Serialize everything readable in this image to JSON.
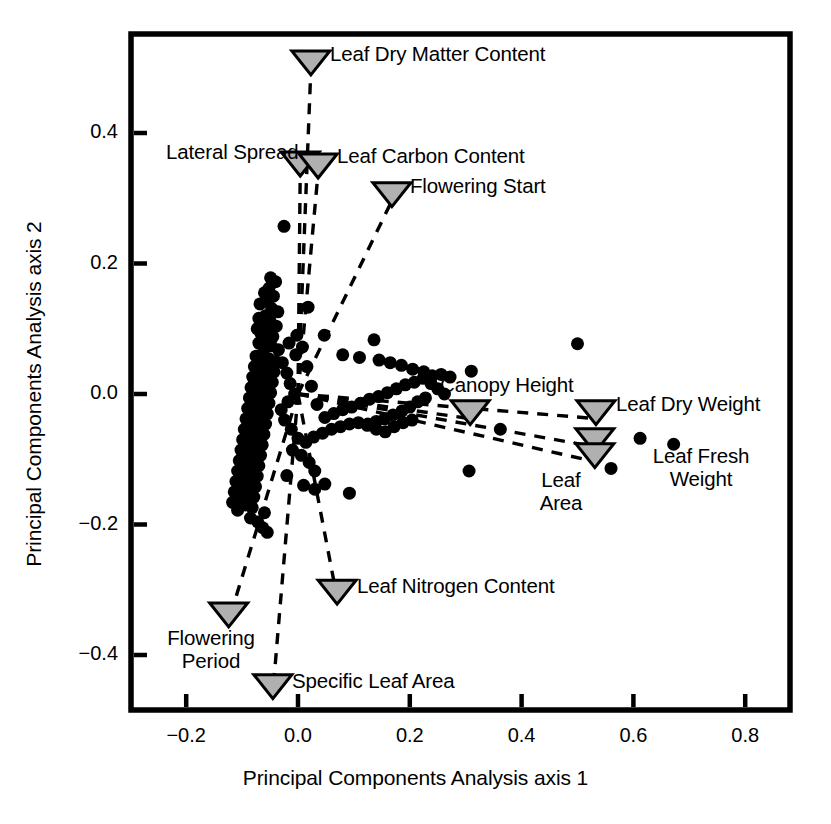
{
  "chart_data": {
    "type": "scatter",
    "title": "",
    "xlabel": "Principal Components Analysis axis 1",
    "ylabel": "Principal Components Analysis axis 2",
    "xlim": [
      -0.278,
      0.901
    ],
    "ylim": [
      -0.486,
      0.552
    ],
    "xticks": [
      -0.2,
      0.0,
      0.2,
      0.4,
      0.6,
      0.8
    ],
    "xticklabels": [
      "−0.2",
      "0.0",
      "0.2",
      "0.4",
      "0.6",
      "0.8"
    ],
    "yticks": [
      0.4,
      0.2,
      0.0,
      -0.2,
      -0.4
    ],
    "yticklabels": [
      "0.4",
      "0.2",
      "0.0",
      "−0.2",
      "−0.4"
    ],
    "grid": false,
    "legend": "none",
    "marker_color": "#000000",
    "marker_shape": "circle",
    "marker_size_px": 13,
    "loading_marker_shape": "triangle-down",
    "loading_marker_fill": "#b0b0b0",
    "loading_marker_stroke": "#000000",
    "loading_line_style": "dashed",
    "loading_origin": [
      0.0,
      0.0
    ],
    "series": [
      {
        "name": "species scores",
        "points": [
          [
            -0.025,
            0.257
          ],
          [
            -0.049,
            0.178
          ],
          [
            -0.04,
            0.172
          ],
          [
            -0.052,
            0.162
          ],
          [
            -0.06,
            0.155
          ],
          [
            -0.044,
            0.15
          ],
          [
            -0.055,
            0.142
          ],
          [
            -0.068,
            0.138
          ],
          [
            -0.047,
            0.131
          ],
          [
            0.018,
            0.133
          ],
          [
            -0.036,
            0.126
          ],
          [
            -0.058,
            0.12
          ],
          [
            -0.07,
            0.116
          ],
          [
            -0.05,
            0.112
          ],
          [
            -0.062,
            0.107
          ],
          [
            -0.039,
            0.104
          ],
          [
            -0.073,
            0.1
          ],
          [
            -0.054,
            0.096
          ],
          [
            -0.066,
            0.092
          ],
          [
            -0.045,
            0.088
          ],
          [
            0.047,
            0.09
          ],
          [
            0.136,
            0.083
          ],
          [
            -0.057,
            0.082
          ],
          [
            -0.07,
            0.078
          ],
          [
            -0.048,
            0.074
          ],
          [
            -0.06,
            0.07
          ],
          [
            -0.035,
            0.068
          ],
          [
            0.08,
            0.06
          ],
          [
            0.11,
            0.056
          ],
          [
            0.145,
            0.052
          ],
          [
            0.165,
            0.048
          ],
          [
            0.185,
            0.044
          ],
          [
            0.205,
            0.038
          ],
          [
            0.225,
            0.034
          ],
          [
            0.5,
            0.077
          ],
          [
            0.31,
            0.035
          ],
          [
            -0.063,
            0.062
          ],
          [
            -0.075,
            0.058
          ],
          [
            -0.052,
            0.054
          ],
          [
            -0.04,
            0.05
          ],
          [
            -0.066,
            0.046
          ],
          [
            -0.078,
            0.042
          ],
          [
            -0.055,
            0.038
          ],
          [
            -0.043,
            0.034
          ],
          [
            -0.069,
            0.03
          ],
          [
            -0.081,
            0.026
          ],
          [
            -0.058,
            0.022
          ],
          [
            -0.046,
            0.018
          ],
          [
            -0.072,
            0.014
          ],
          [
            -0.084,
            0.01
          ],
          [
            -0.061,
            0.006
          ],
          [
            -0.049,
            0.002
          ],
          [
            -0.075,
            -0.002
          ],
          [
            -0.087,
            -0.006
          ],
          [
            -0.064,
            -0.01
          ],
          [
            -0.052,
            -0.014
          ],
          [
            -0.078,
            -0.018
          ],
          [
            -0.09,
            -0.022
          ],
          [
            -0.067,
            -0.026
          ],
          [
            -0.055,
            -0.03
          ],
          [
            -0.081,
            -0.034
          ],
          [
            -0.093,
            -0.038
          ],
          [
            -0.07,
            -0.042
          ],
          [
            -0.058,
            -0.046
          ],
          [
            -0.084,
            -0.05
          ],
          [
            -0.096,
            -0.054
          ],
          [
            -0.073,
            -0.058
          ],
          [
            -0.061,
            -0.062
          ],
          [
            -0.087,
            -0.066
          ],
          [
            -0.099,
            -0.07
          ],
          [
            -0.076,
            -0.074
          ],
          [
            -0.064,
            -0.078
          ],
          [
            -0.09,
            -0.082
          ],
          [
            -0.102,
            -0.086
          ],
          [
            -0.079,
            -0.09
          ],
          [
            -0.067,
            -0.094
          ],
          [
            -0.093,
            -0.098
          ],
          [
            -0.105,
            -0.102
          ],
          [
            -0.082,
            -0.106
          ],
          [
            -0.07,
            -0.11
          ],
          [
            -0.096,
            -0.114
          ],
          [
            -0.108,
            -0.118
          ],
          [
            -0.085,
            -0.122
          ],
          [
            -0.073,
            -0.126
          ],
          [
            -0.099,
            -0.13
          ],
          [
            -0.111,
            -0.134
          ],
          [
            -0.088,
            -0.138
          ],
          [
            -0.076,
            -0.142
          ],
          [
            -0.102,
            -0.146
          ],
          [
            -0.114,
            -0.15
          ],
          [
            -0.091,
            -0.154
          ],
          [
            -0.079,
            -0.158
          ],
          [
            -0.105,
            -0.162
          ],
          [
            -0.117,
            -0.166
          ],
          [
            -0.094,
            -0.17
          ],
          [
            -0.082,
            -0.174
          ],
          [
            -0.108,
            -0.178
          ],
          [
            -0.06,
            -0.182
          ],
          [
            -0.085,
            -0.19
          ],
          [
            -0.072,
            -0.196
          ],
          [
            -0.063,
            -0.205
          ],
          [
            -0.055,
            -0.212
          ],
          [
            -0.02,
            -0.125
          ],
          [
            0.01,
            -0.14
          ],
          [
            0.03,
            -0.146
          ],
          [
            0.048,
            -0.138
          ],
          [
            0.092,
            -0.152
          ],
          [
            0.03,
            -0.118
          ],
          [
            0.02,
            -0.105
          ],
          [
            0.006,
            -0.094
          ],
          [
            -0.01,
            -0.086
          ],
          [
            0.014,
            -0.074
          ],
          [
            0.028,
            -0.066
          ],
          [
            0.044,
            -0.06
          ],
          [
            0.06,
            -0.054
          ],
          [
            0.076,
            -0.05
          ],
          [
            0.092,
            -0.046
          ],
          [
            0.108,
            -0.044
          ],
          [
            0.124,
            -0.048
          ],
          [
            0.14,
            -0.054
          ],
          [
            0.156,
            -0.058
          ],
          [
            0.172,
            -0.05
          ],
          [
            0.188,
            -0.044
          ],
          [
            0.204,
            -0.04
          ],
          [
            0.048,
            -0.036
          ],
          [
            0.064,
            -0.03
          ],
          [
            0.08,
            -0.024
          ],
          [
            0.096,
            -0.02
          ],
          [
            0.112,
            -0.014
          ],
          [
            0.128,
            -0.008
          ],
          [
            0.144,
            -0.004
          ],
          [
            0.16,
            0.002
          ],
          [
            0.176,
            0.008
          ],
          [
            0.192,
            0.014
          ],
          [
            0.208,
            0.018
          ],
          [
            0.224,
            0.024
          ],
          [
            0.24,
            0.028
          ],
          [
            0.256,
            0.03
          ],
          [
            0.272,
            0.026
          ],
          [
            0.238,
            0.016
          ],
          [
            0.25,
            0.008
          ],
          [
            0.262,
            0.0
          ],
          [
            0.228,
            -0.006
          ],
          [
            0.214,
            -0.012
          ],
          [
            0.2,
            -0.02
          ],
          [
            0.186,
            -0.026
          ],
          [
            0.17,
            -0.032
          ],
          [
            0.155,
            -0.038
          ],
          [
            0.14,
            -0.042
          ],
          [
            0.125,
            -0.046
          ],
          [
            0.362,
            -0.054
          ],
          [
            0.306,
            -0.118
          ],
          [
            0.56,
            -0.114
          ],
          [
            0.612,
            -0.068
          ],
          [
            0.672,
            -0.077
          ],
          [
            -0.028,
            0.048
          ],
          [
            -0.02,
            0.032
          ],
          [
            -0.014,
            0.016
          ],
          [
            -0.006,
            0.0
          ],
          [
            -0.018,
            -0.012
          ],
          [
            -0.03,
            -0.024
          ],
          [
            -0.024,
            -0.04
          ],
          [
            -0.012,
            -0.054
          ],
          [
            0.0,
            -0.068
          ],
          [
            -0.004,
            0.06
          ],
          [
            -0.016,
            0.078
          ],
          [
            -0.002,
            0.09
          ],
          [
            0.008,
            0.072
          ],
          [
            0.016,
            0.042
          ],
          [
            0.024,
            0.012
          ],
          [
            0.034,
            -0.016
          ]
        ]
      }
    ],
    "loadings": [
      {
        "name": "Leaf Dry Matter Content",
        "x": 0.023,
        "y": 0.509,
        "label": "Leaf Dry Matter Content"
      },
      {
        "name": "Lateral Spread",
        "x": 0.004,
        "y": 0.354,
        "label": "Lateral Spread"
      },
      {
        "name": "Leaf Carbon Content",
        "x": 0.036,
        "y": 0.351,
        "label": "Leaf Carbon Content"
      },
      {
        "name": "Flowering Start",
        "x": 0.168,
        "y": 0.307,
        "label": "Flowering Start"
      },
      {
        "name": "Canopy Height",
        "x": 0.308,
        "y": -0.027,
        "label": "Canopy Height"
      },
      {
        "name": "Leaf Dry Weight",
        "x": 0.533,
        "y": -0.027,
        "label": "Leaf Dry Weight"
      },
      {
        "name": "Leaf Fresh Weight",
        "x": 0.531,
        "y": -0.07,
        "label": "Leaf Fresh\nWeight"
      },
      {
        "name": "Leaf Area",
        "x": 0.531,
        "y": -0.093,
        "label": "Leaf\nArea"
      },
      {
        "name": "Leaf Nitrogen Content",
        "x": 0.07,
        "y": -0.302,
        "label": "Leaf Nitrogen Content"
      },
      {
        "name": "Flowering Period",
        "x": -0.124,
        "y": -0.337,
        "label": "Flowering\nPeriod"
      },
      {
        "name": "Specific Leaf Area",
        "x": -0.045,
        "y": -0.447,
        "label": "Specific Leaf Area"
      }
    ]
  },
  "axes": {
    "xlabel": "Principal Components Analysis axis 1",
    "ylabel": "Principal Components Analysis axis 2",
    "xticklabels": [
      "−0.2",
      "0.0",
      "0.2",
      "0.4",
      "0.6",
      "0.8"
    ],
    "yticklabels": [
      "0.4",
      "0.2",
      "0.0",
      "−0.2",
      "−0.4"
    ]
  },
  "labels": {
    "leaf_dry_matter_content": "Leaf Dry Matter Content",
    "lateral_spread": "Lateral Spread",
    "leaf_carbon_content": "Leaf Carbon Content",
    "flowering_start": "Flowering Start",
    "canopy_height": "Canopy Height",
    "leaf_dry_weight": "Leaf Dry Weight",
    "leaf_fresh_weight_l1": "Leaf Fresh",
    "leaf_fresh_weight_l2": "Weight",
    "leaf_area_l1": "Leaf",
    "leaf_area_l2": "Area",
    "leaf_nitrogen_content": "Leaf Nitrogen Content",
    "flowering_period_l1": "Flowering",
    "flowering_period_l2": "Period",
    "specific_leaf_area": "Specific Leaf Area"
  },
  "colors": {
    "marker": "#000000",
    "loading_fill": "#b0b0b0",
    "loading_stroke": "#000000",
    "frame": "#000000",
    "background": "#ffffff"
  }
}
